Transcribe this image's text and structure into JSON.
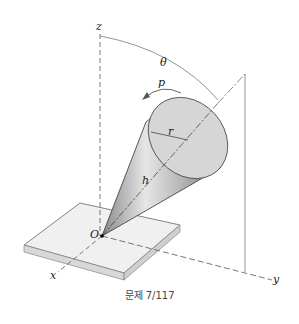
{
  "figure": {
    "labels": {
      "z": "z",
      "x": "x",
      "y": "y",
      "origin": "O",
      "theta": "θ",
      "p": "p",
      "r": "r",
      "h": "h"
    },
    "caption": "문제 7/117"
  }
}
